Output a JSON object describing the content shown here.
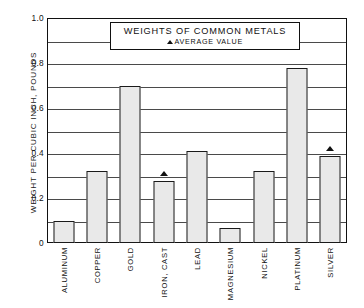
{
  "chart_data": {
    "type": "bar",
    "title": "WEIGHTS OF COMMON METALS",
    "legend_label": "AVERAGE VALUE",
    "legend_marker": "triangle-up",
    "legend_position": "inside-top-center",
    "xlabel": "",
    "ylabel": "WEIGHT PER CUBIC INCH, POUNDS",
    "ylim": [
      0,
      1.0
    ],
    "grid": true,
    "grid_interval": 0.1,
    "categories": [
      "ALUMINUM",
      "COPPER",
      "GOLD",
      "IRON, CAST",
      "LEAD",
      "MAGNESIUM",
      "NICKEL",
      "PLATINUM",
      "SILVER"
    ],
    "values": [
      0.1,
      0.32,
      0.7,
      0.275,
      0.41,
      0.065,
      0.32,
      0.78,
      0.385
    ],
    "average_markers": [
      {
        "category": "IRON, CAST",
        "value": 0.3
      },
      {
        "category": "SILVER",
        "value": 0.41
      }
    ],
    "ytick_labels": [
      "0",
      "0.2",
      "0.4",
      "0.6",
      "0.8",
      "1.0"
    ],
    "ytick_values": [
      0,
      0.2,
      0.4,
      0.6,
      0.8,
      1.0
    ],
    "gridline_values": [
      0.1,
      0.2,
      0.3,
      0.4,
      0.5,
      0.6,
      0.7,
      0.8,
      0.9
    ],
    "colors": {
      "bar_fill": "#e9e9e9",
      "bar_stroke": "#1a1a1a",
      "grid": "#4a4a4a",
      "frame": "#111111",
      "background": "#ffffff"
    }
  }
}
